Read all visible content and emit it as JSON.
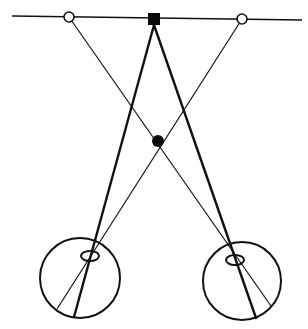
{
  "diagram": {
    "type": "binocular-vision-geometry",
    "colors": {
      "background": "#ffffff",
      "stroke": "#111111",
      "fill_dark": "#0a0a0a",
      "fill_light": "#ffffff"
    },
    "horizon_line": {
      "x1": 12,
      "y1": 16,
      "x2": 302,
      "y2": 20,
      "stroke_width": 1.3
    },
    "targets": {
      "fixation_square": {
        "cx": 154,
        "cy": 19,
        "size": 12
      },
      "left_open_circle": {
        "cx": 69,
        "cy": 17,
        "r": 5
      },
      "right_open_circle": {
        "cx": 242,
        "cy": 19,
        "r": 5
      },
      "near_filled_dot": {
        "cx": 158,
        "cy": 141,
        "r": 6
      }
    },
    "eyes": {
      "left": {
        "globe": {
          "cx": 80,
          "cy": 278,
          "r": 40
        },
        "lens": {
          "cx": 90,
          "cy": 256,
          "rx": 9,
          "ry": 5
        },
        "thick_ray_end": {
          "x": 74,
          "y": 317
        },
        "thin_ray_end": {
          "x": 57,
          "y": 309
        }
      },
      "right": {
        "globe": {
          "cx": 242,
          "cy": 281,
          "r": 39
        },
        "lens": {
          "cx": 235,
          "cy": 260,
          "rx": 9,
          "ry": 5
        },
        "thick_ray_end": {
          "x": 256,
          "y": 318
        },
        "thin_ray_end": {
          "x": 271,
          "y": 306
        }
      }
    }
  }
}
